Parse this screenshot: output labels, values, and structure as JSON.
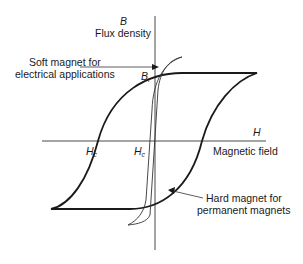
{
  "diagram": {
    "type": "hysteresis-loop",
    "axes": {
      "y_symbol": "B",
      "y_label": "Flux density",
      "x_symbol": "H",
      "x_label": "Magnetic field"
    },
    "points": {
      "remanence_symbol": "B",
      "remanence_subscript": "r",
      "coercivity_symbol": "H",
      "coercivity_subscript": "c"
    },
    "annotations": {
      "soft_line1": "Soft magnet for",
      "soft_line2": "electrical applications",
      "hard_line1": "Hard magnet for",
      "hard_line2": "permanent magnets"
    },
    "colors": {
      "line": "#1a1a1a",
      "background": "#ffffff"
    }
  }
}
